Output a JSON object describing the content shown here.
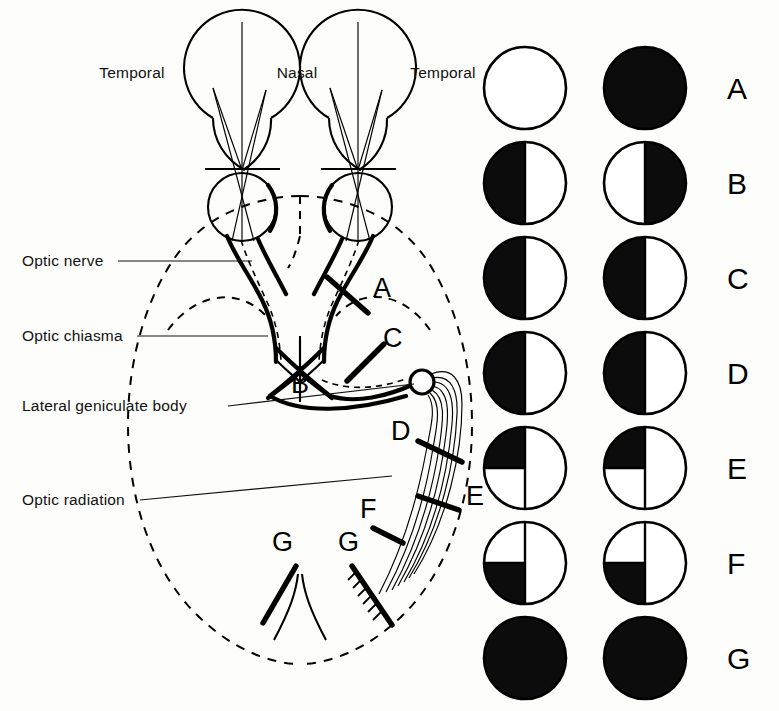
{
  "diagram": {
    "top_labels": [
      {
        "id": "temporal-left",
        "text": "Temporal",
        "x": 132,
        "y": 78
      },
      {
        "id": "nasal",
        "text": "Nasal",
        "x": 292,
        "y": 78
      },
      {
        "id": "temporal-right",
        "text": "Temporal",
        "x": 408,
        "y": 78
      }
    ],
    "structure_labels": [
      {
        "id": "optic-nerve",
        "text": "Optic nerve",
        "x": 22,
        "y": 266,
        "leader": {
          "x1": 118,
          "y1": 261,
          "x2": 252,
          "y2": 261
        }
      },
      {
        "id": "optic-chiasma",
        "text": "Optic chiasma",
        "x": 22,
        "y": 341,
        "leader": {
          "x1": 137,
          "y1": 336,
          "x2": 268,
          "y2": 336
        }
      },
      {
        "id": "lateral-geniculate-body",
        "text": "Lateral geniculate body",
        "x": 22,
        "y": 411,
        "leader": {
          "x1": 228,
          "y1": 406,
          "x2": 418,
          "y2": 383
        }
      },
      {
        "id": "optic-radiation",
        "text": "Optic radiation",
        "x": 22,
        "y": 505,
        "leader": {
          "x1": 140,
          "y1": 500,
          "x2": 390,
          "y2": 477
        }
      }
    ],
    "lesion_markers": [
      {
        "id": "lesion-a",
        "letter": "A",
        "x": 373,
        "y": 297
      },
      {
        "id": "lesion-c",
        "letter": "C",
        "x": 383,
        "y": 347
      },
      {
        "id": "lesion-b",
        "letter": "B",
        "x": 305,
        "y": 390
      },
      {
        "id": "lesion-d",
        "letter": "D",
        "x": 391,
        "y": 440
      },
      {
        "id": "lesion-e",
        "letter": "E",
        "x": 466,
        "y": 505
      },
      {
        "id": "lesion-f",
        "letter": "F",
        "x": 364,
        "y": 518
      },
      {
        "id": "lesion-g-left",
        "letter": "G",
        "x": 277,
        "y": 551
      },
      {
        "id": "lesion-g-right",
        "letter": "G",
        "x": 343,
        "y": 551
      }
    ]
  },
  "field_chart": {
    "column_headers": [
      "Left eye",
      "Right eye"
    ],
    "rows": [
      {
        "letter": "A",
        "name": "total-blindness-right-eye",
        "left": "clear",
        "right": "full"
      },
      {
        "letter": "B",
        "name": "bitemporal-hemianopia",
        "left": "left-half",
        "right": "right-half"
      },
      {
        "letter": "C",
        "name": "homonymous-hemianopia-1",
        "left": "left-half",
        "right": "left-half"
      },
      {
        "letter": "D",
        "name": "homonymous-hemianopia-2",
        "left": "left-half",
        "right": "left-half"
      },
      {
        "letter": "E",
        "name": "upper-quadrantanopia",
        "left": "upper-left-quadrant",
        "right": "upper-left-quadrant"
      },
      {
        "letter": "F",
        "name": "lower-quadrantanopia",
        "left": "lower-left-quadrant",
        "right": "lower-left-quadrant"
      },
      {
        "letter": "G",
        "name": "cortical-blindness",
        "left": "full",
        "right": "full"
      }
    ]
  },
  "colors": {
    "ink": "#000000",
    "paper": "#fdfdfb",
    "defect_fill": "#0c0c0c"
  }
}
